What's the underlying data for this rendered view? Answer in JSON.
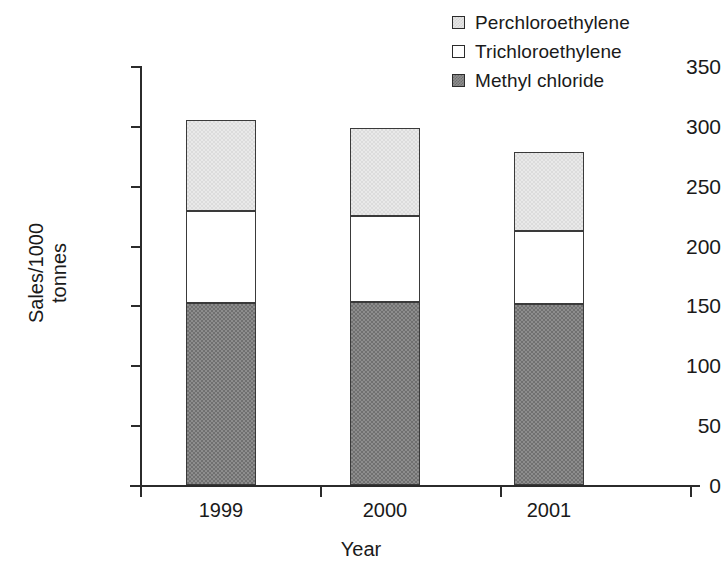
{
  "chart_data": {
    "type": "bar",
    "subtype": "stacked-bar",
    "title": "",
    "xlabel": "Year",
    "ylabel": "Sales/1000 tonnes",
    "categories": [
      "1999",
      "2000",
      "2001"
    ],
    "ylim": [
      0,
      350
    ],
    "yticks": [
      0,
      50,
      100,
      150,
      200,
      250,
      300,
      350
    ],
    "ytick_labels": [
      "0",
      "50",
      "100",
      "150",
      "200",
      "250",
      "300",
      "350"
    ],
    "grid": false,
    "legend_position": "top-right",
    "series": [
      {
        "name": "Perchloroethylene",
        "values": [
          76,
          73,
          66
        ],
        "color": "#e9e9e9",
        "swatch": "sw-perc"
      },
      {
        "name": "Trichloroethylene",
        "values": [
          77,
          72,
          61
        ],
        "color": "#ffffff",
        "swatch": "sw-tri"
      },
      {
        "name": "Methyl chloride",
        "values": [
          152,
          153,
          151
        ],
        "color": "#8d8d8d",
        "swatch": "sw-meth"
      }
    ],
    "stack_tops": {
      "methyl_chloride": [
        152,
        153,
        151
      ],
      "trichloroethylene": [
        229,
        225,
        212
      ],
      "perchloroethylene": [
        305,
        298,
        278
      ]
    },
    "totals": [
      305,
      298,
      278
    ]
  },
  "legend": {
    "items": [
      {
        "label": "Perchloroethylene"
      },
      {
        "label": "Trichloroethylene"
      },
      {
        "label": "Methyl chloride"
      }
    ]
  },
  "axes": {
    "y": {
      "title_line1": "Sales/1000",
      "title_line2": "tonnes",
      "ticks": [
        "350",
        "300",
        "250",
        "200",
        "150",
        "100",
        "50",
        "0"
      ]
    },
    "x": {
      "title": "Year",
      "ticks": [
        "1999",
        "2000",
        "2001"
      ]
    }
  }
}
